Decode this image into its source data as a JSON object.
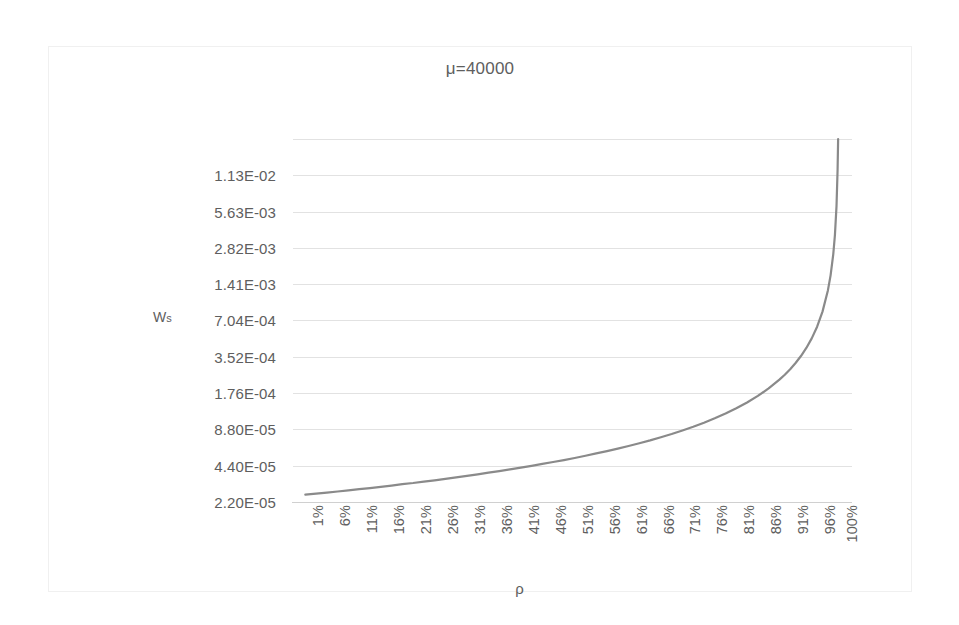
{
  "chart_data": {
    "type": "line",
    "title": "μ=40000",
    "xlabel": "ρ",
    "ylabel": "Ws",
    "yscale": "log",
    "grid": true,
    "legend": "none",
    "series_color": "#8a8a8a",
    "grid_color": "#e2e2e2",
    "text_color": "#5e5e5e",
    "ylim": [
      2.2e-05,
      0.0225
    ],
    "ytick_labels": [
      "1.13E-02",
      "5.63E-03",
      "2.82E-03",
      "1.41E-03",
      "7.04E-04",
      "3.52E-04",
      "1.76E-04",
      "8.80E-05",
      "4.40E-05",
      "2.20E-05"
    ],
    "ytick_values": [
      0.0113,
      0.00563,
      0.00282,
      0.00141,
      0.000704,
      0.000352,
      0.000176,
      8.8e-05,
      4.4e-05,
      2.2e-05
    ],
    "xtick_labels": [
      "1%",
      "6%",
      "11%",
      "16%",
      "21%",
      "26%",
      "31%",
      "36%",
      "41%",
      "46%",
      "51%",
      "56%",
      "61%",
      "66%",
      "71%",
      "76%",
      "81%",
      "86%",
      "91%",
      "96%",
      "100%"
    ],
    "xtick_values": [
      1,
      6,
      11,
      16,
      21,
      26,
      31,
      36,
      41,
      46,
      51,
      56,
      61,
      66,
      71,
      76,
      81,
      86,
      91,
      96,
      100
    ],
    "series": [
      {
        "name": "Ws",
        "x": [
          1,
          3,
          5,
          7,
          9,
          11,
          13,
          15,
          17,
          19,
          21,
          23,
          25,
          27,
          29,
          31,
          33,
          35,
          37,
          39,
          41,
          43,
          45,
          47,
          49,
          51,
          53,
          55,
          57,
          59,
          61,
          63,
          65,
          67,
          69,
          71,
          73,
          75,
          77,
          79,
          81,
          83,
          85,
          87,
          89,
          90,
          91,
          92,
          93,
          94,
          95,
          96,
          97,
          98,
          98.5,
          99,
          99.3,
          99.6,
          99.8,
          99.9
        ],
        "y": [
          2.53e-05,
          2.58e-05,
          2.63e-05,
          2.69e-05,
          2.75e-05,
          2.81e-05,
          2.87e-05,
          2.94e-05,
          3.01e-05,
          3.09e-05,
          3.16e-05,
          3.25e-05,
          3.33e-05,
          3.42e-05,
          3.52e-05,
          3.62e-05,
          3.73e-05,
          3.85e-05,
          3.97e-05,
          4.1e-05,
          4.24e-05,
          4.39e-05,
          4.55e-05,
          4.72e-05,
          4.9e-05,
          5.1e-05,
          5.32e-05,
          5.56e-05,
          5.81e-05,
          6.1e-05,
          6.41e-05,
          6.76e-05,
          7.14e-05,
          7.58e-05,
          8.06e-05,
          8.62e-05,
          9.26e-05,
          0.0001,
          0.0001087,
          0.000119,
          0.0001316,
          0.000147,
          0.0001667,
          0.0001923,
          0.0002273,
          0.00025,
          0.0002778,
          0.0003125,
          0.0003571,
          0.0004167,
          0.0005,
          0.000625,
          0.0008333,
          0.00125,
          0.0016667,
          0.0025,
          0.0035714,
          0.00625,
          0.0125,
          0.025
        ]
      }
    ]
  },
  "axis_titles": {
    "y_main": "W",
    "y_sub": "s",
    "x": "ρ"
  }
}
